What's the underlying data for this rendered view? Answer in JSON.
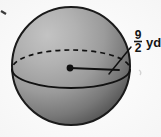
{
  "figure": {
    "kind": "sphere-diagram",
    "background_color": "#fbfbfb",
    "sphere": {
      "center_x": 71,
      "center_y": 66,
      "radius": 59,
      "fill_light": "#b9b9b9",
      "fill_mid": "#9a9a9a",
      "fill_dark": "#4a4a4a",
      "outline_color": "#1a1a1a",
      "highlight_x": 44,
      "highlight_y": 32
    },
    "equator": {
      "center_x": 71,
      "center_y": 69,
      "rx": 59,
      "ry": 19,
      "back_half_style": "dashed",
      "front_half_style": "solid",
      "stroke_color": "#111111",
      "dash_pattern": "5,4"
    },
    "center_point": {
      "x": 70,
      "y": 68,
      "radius": 3.4,
      "color": "#111111"
    },
    "radius_line": {
      "from_x": 70,
      "from_y": 68,
      "to_x": 119,
      "to_y": 70,
      "color": "#111111"
    },
    "leader_line": {
      "from_x": 131,
      "from_y": 47,
      "to_x": 109,
      "to_y": 74,
      "color": "#111111"
    },
    "measurement_label": {
      "name": "radius-measurement",
      "numerator": "9",
      "denominator": "2",
      "fraction_text": "9/2",
      "unit": "yd",
      "full_text": "9/2 yd",
      "x": 137,
      "y": 40
    },
    "artifacts": {
      "corner_mark": {
        "x": 2,
        "y": 12,
        "color": "#3a3a3a"
      },
      "smudge_mark": {
        "x": 141,
        "y": 73,
        "color": "#d9d9d9"
      }
    }
  }
}
